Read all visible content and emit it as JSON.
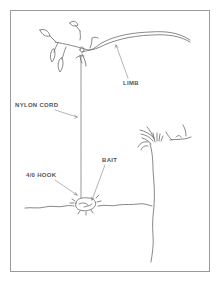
{
  "diagram": {
    "type": "illustration",
    "labels": {
      "limb": "LIMB",
      "nylon_cord": "NYLON CORD",
      "bait": "BAIT",
      "hook": "4/0 HOOK"
    },
    "colors": {
      "line": "#6a6a6a",
      "frame": "#9a9a9a",
      "text": "#555555",
      "background": "#ffffff"
    }
  }
}
